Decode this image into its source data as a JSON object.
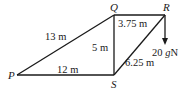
{
  "diagram": {
    "type": "framework",
    "points": {
      "P": {
        "label": "P",
        "x": 17,
        "y": 75
      },
      "Q": {
        "label": "Q",
        "x": 114,
        "y": 15
      },
      "R": {
        "label": "R",
        "x": 165,
        "y": 15
      },
      "S": {
        "label": "S",
        "x": 114,
        "y": 75
      }
    },
    "members": [
      {
        "id": "PQ",
        "from": "P",
        "to": "Q",
        "length_label": "13 m"
      },
      {
        "id": "PS",
        "from": "P",
        "to": "S",
        "length_label": "12 m"
      },
      {
        "id": "QS",
        "from": "Q",
        "to": "S",
        "length_label": "5 m"
      },
      {
        "id": "QR",
        "from": "Q",
        "to": "R",
        "length_label": "3.75 m"
      },
      {
        "id": "RS",
        "from": "R",
        "to": "S",
        "length_label": "6.25 m"
      }
    ],
    "load": {
      "at": "R",
      "direction": "down",
      "label_num": "20 ",
      "label_g": "g",
      "label_unit": "N"
    },
    "colors": {
      "ink": "#1a1a1a",
      "background": "#ffffff"
    }
  }
}
